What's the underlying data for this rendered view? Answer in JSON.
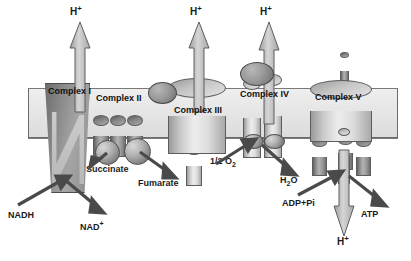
{
  "diagram": {
    "type": "biochemical-pathway-schematic",
    "membrane": {
      "label": "inner mitochondrial membrane",
      "color": "#e7e7e7",
      "border": "#6b6b6b"
    }
  },
  "complexes": [
    {
      "id": "complex-i",
      "label": "Complex I",
      "shape": "slab"
    },
    {
      "id": "complex-ii",
      "label": "Complex II",
      "shape": "triple-cylinder"
    },
    {
      "id": "complex-iii",
      "label": "Complex III",
      "shape": "cylinder"
    },
    {
      "id": "complex-iv",
      "label": "Complex IV",
      "shape": "double-cylinder"
    },
    {
      "id": "complex-v",
      "label": "Complex V",
      "shape": "cylinder-with-stalk"
    }
  ],
  "carriers": [
    {
      "id": "coq",
      "label": "CoQ"
    },
    {
      "id": "cyt-c",
      "label": "Cyt c"
    }
  ],
  "proton_labels": [
    {
      "id": "h-plus-complex-i",
      "text": "H",
      "sup": "+",
      "position": "top",
      "x": 78,
      "y": 10
    },
    {
      "id": "h-plus-complex-iii",
      "text": "H",
      "sup": "+",
      "position": "top",
      "x": 196,
      "y": 10
    },
    {
      "id": "h-plus-complex-iv",
      "text": "H",
      "sup": "+",
      "position": "top",
      "x": 266,
      "y": 10
    },
    {
      "id": "h-plus-complex-v",
      "text": "H",
      "sup": "+",
      "position": "bottom",
      "x": 340,
      "y": 238
    }
  ],
  "metabolites": {
    "nadh": {
      "label": "NADH",
      "x": 8,
      "y": 212
    },
    "nad_plus": {
      "label": "NAD",
      "sup": "+",
      "x": 78,
      "y": 222
    },
    "succinate": {
      "label": "Succinate",
      "x": 88,
      "y": 165
    },
    "fumarate": {
      "label": "Fumarate",
      "x": 139,
      "y": 179
    },
    "half_o2": {
      "label": "1/2 O",
      "sub": "2",
      "x": 212,
      "y": 158
    },
    "water": {
      "label": "H",
      "sub": "2",
      "tail": "O",
      "x": 281,
      "y": 177
    },
    "adp_pi": {
      "label": "ADP+Pi",
      "x": 283,
      "y": 200
    },
    "atp": {
      "label": "ATP",
      "x": 362,
      "y": 210
    }
  },
  "legend_note": "Electrons flow from NADH and succinate through the chain to O2; protons are pumped across the membrane and return through Complex V to make ATP."
}
